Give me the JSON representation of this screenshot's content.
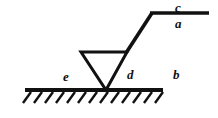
{
  "diagram": {
    "type": "line-drawing",
    "canvas": {
      "width": 218,
      "height": 118,
      "background": "#ffffff"
    },
    "stroke_color": "#111111",
    "labels": {
      "a": "a",
      "b": "b",
      "c": "c",
      "d": "d",
      "e": "e"
    },
    "label_positions": {
      "a": {
        "x": 175,
        "y": 17,
        "description": "below the top-right horizontal bar"
      },
      "b": {
        "x": 173,
        "y": 68,
        "description": "right region above the ground line"
      },
      "c": {
        "x": 175,
        "y": 1,
        "description": "above the top-right horizontal bar"
      },
      "d": {
        "x": 127,
        "y": 68,
        "description": "right of the triangle, above the ground line"
      },
      "e": {
        "x": 63,
        "y": 70,
        "description": "left of the triangle, above the ground line"
      }
    },
    "geometry": {
      "ground_line": {
        "x1": 25,
        "y1": 90,
        "x2": 163,
        "y2": 90,
        "stroke_width": 4
      },
      "hatch_marks": {
        "count": 12,
        "start_x": 27,
        "spacing": 11.5,
        "length_x": -8,
        "length_y": 10,
        "stroke_width": 2.4,
        "description": "diagonal ticks below ground line slanting down-left"
      },
      "triangle": {
        "apex": {
          "x": 106,
          "y": 90
        },
        "top_left": {
          "x": 81,
          "y": 52
        },
        "top_right": {
          "x": 127,
          "y": 52
        },
        "stroke_width": 3,
        "orientation": "inverted",
        "fill": "none"
      },
      "inclined_link": {
        "x1": 127,
        "y1": 52,
        "x2": 152,
        "y2": 13,
        "stroke_width": 3.6
      },
      "top_bar": {
        "x1": 150,
        "y1": 13,
        "x2": 209,
        "y2": 13,
        "stroke_width": 3.6
      }
    }
  }
}
